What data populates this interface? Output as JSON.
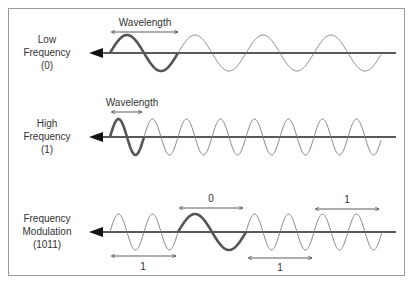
{
  "diagram": {
    "rows": [
      {
        "id": "low",
        "title_line1": "Low",
        "title_line2": "Frequency",
        "title_line3": "(0)",
        "wavelength_label": "Wavelength"
      },
      {
        "id": "high",
        "title_line1": "High",
        "title_line2": "Frequency",
        "title_line3": "(1)",
        "wavelength_label": "Wavelength"
      },
      {
        "id": "fm",
        "title_line1": "Frequency",
        "title_line2": "Modulation",
        "title_line3": "(1011)",
        "segments": [
          {
            "bit": "1"
          },
          {
            "bit": "0"
          },
          {
            "bit": "1"
          },
          {
            "bit": "1"
          }
        ]
      }
    ],
    "colors": {
      "axis": "#222222",
      "wave": "#777777",
      "highlight": "#555555",
      "border": "#9a9a9a"
    }
  }
}
